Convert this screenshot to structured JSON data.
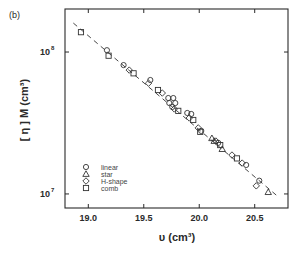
{
  "panel_label": "(b)",
  "chart_data": {
    "type": "scatter",
    "title": "",
    "xlabel": "υ (cm³)",
    "ylabel": "[ η ] M (cm³)",
    "xscale": "linear",
    "yscale": "log",
    "xlim": [
      18.79,
      20.8
    ],
    "ylim": [
      7960000.0,
      201000000.0
    ],
    "grid": false,
    "xticks": [
      19.0,
      19.5,
      20.0,
      20.5
    ],
    "xtick_labels": [
      "19.0",
      "19.5",
      "20.0",
      "20.5"
    ],
    "yticks": [
      10000000.0,
      100000000.0
    ],
    "ytick_labels": [
      {
        "base": "10",
        "exp": "7"
      },
      {
        "base": "10",
        "exp": "8"
      }
    ],
    "legend": {
      "position": "lower left (inside)",
      "entries": [
        {
          "label": "linear",
          "marker": "circle"
        },
        {
          "label": "star",
          "marker": "triangle"
        },
        {
          "label": "H-shape",
          "marker": "diamond"
        },
        {
          "label": "comb",
          "marker": "square"
        }
      ]
    },
    "series": [
      {
        "name": "linear",
        "marker": "circle",
        "points": [
          [
            19.168,
            103000000.0
          ],
          [
            19.318,
            80900000.0
          ],
          [
            19.559,
            63500000.0
          ],
          [
            19.721,
            47400000.0
          ],
          [
            19.766,
            47400000.0
          ],
          [
            19.73,
            43700000.0
          ],
          [
            19.784,
            43700000.0
          ],
          [
            19.757,
            41000000.0
          ],
          [
            19.892,
            37200000.0
          ],
          [
            19.928,
            36600000.0
          ],
          [
            20.018,
            27800000.0
          ],
          [
            20.171,
            22900000.0
          ],
          [
            20.423,
            16000000.0
          ],
          [
            20.541,
            12400000.0
          ]
        ]
      },
      {
        "name": "star",
        "marker": "triangle",
        "points": [
          [
            20.114,
            24700000.0
          ],
          [
            20.135,
            23600000.0
          ],
          [
            20.207,
            20700000.0
          ],
          [
            20.622,
            10300000.0
          ]
        ]
      },
      {
        "name": "H-shape",
        "marker": "diamond",
        "points": [
          [
            19.369,
            74600000.0
          ],
          [
            19.543,
            60300000.0
          ],
          [
            19.667,
            51400000.0
          ],
          [
            19.775,
            39700000.0
          ],
          [
            19.91,
            34300000.0
          ],
          [
            19.991,
            29200000.0
          ],
          [
            20.15,
            23600000.0
          ],
          [
            20.295,
            18800000.0
          ],
          [
            20.387,
            16500000.0
          ],
          [
            20.514,
            11400000.0
          ]
        ]
      },
      {
        "name": "comb",
        "marker": "square",
        "points": [
          [
            18.934,
            138000000.0
          ],
          [
            19.183,
            94200000.0
          ],
          [
            19.408,
            70800000.0
          ],
          [
            19.628,
            54000000.0
          ],
          [
            19.811,
            38500000.0
          ],
          [
            19.946,
            33200000.0
          ],
          [
            20.009,
            27400000.0
          ],
          [
            20.189,
            22100000.0
          ],
          [
            20.34,
            17800000.0
          ]
        ]
      }
    ],
    "fit_line": {
      "style": "dashed",
      "x": [
        18.865,
        20.703
      ],
      "y": [
        160000000.0,
        9680000.0
      ]
    }
  }
}
